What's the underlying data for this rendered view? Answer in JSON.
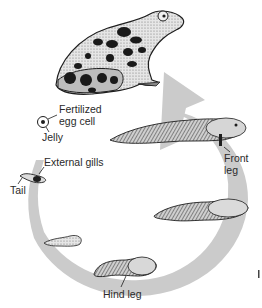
{
  "diagram": {
    "colors": {
      "arrow": "#c9c9c9",
      "ink": "#1e1e1e",
      "skin_light": "#e4e4e4",
      "skin_mid": "#9a9a9a",
      "background": "#ffffff"
    },
    "stages": [
      {
        "id": "adult-frog",
        "name": "Adult frog"
      },
      {
        "id": "egg",
        "name": "Fertilized egg"
      },
      {
        "id": "early-larva",
        "name": "Hatchling with external gills"
      },
      {
        "id": "small-tadpole",
        "name": "Small tadpole"
      },
      {
        "id": "tadpole-hind-leg",
        "name": "Tadpole with hind legs"
      },
      {
        "id": "tadpole-large",
        "name": "Larger tadpole"
      },
      {
        "id": "froglet-front-leg",
        "name": "Tadpole with front legs"
      }
    ],
    "labels": {
      "fertilized_line1": "Fertilized",
      "fertilized_line2": "egg cell",
      "jelly": "Jelly",
      "external_gills": "External gills",
      "tail": "Tail",
      "front_line1": "Front",
      "front_line2": "leg",
      "hind_leg": "Hind leg"
    }
  }
}
